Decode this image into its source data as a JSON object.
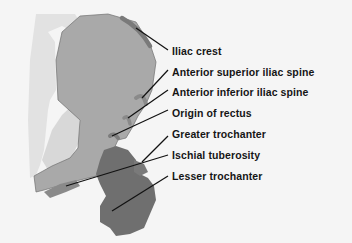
{
  "diagram": {
    "title": "",
    "colors": {
      "background": "#f5f5f5",
      "shadow_region": "#e3e3e3",
      "ilium": "#a8a8a8",
      "ilium_outline": "#707070",
      "femur": "#6e6e6e",
      "attachment": "#7c7c7c",
      "leader_line": "#111111",
      "label_text": "#151515"
    },
    "labels": [
      {
        "id": "iliac-crest",
        "text": "Iliac crest"
      },
      {
        "id": "anterior-superior-iliac-spine",
        "text": "Anterior superior iliac spine"
      },
      {
        "id": "anterior-inferior-iliac-spine",
        "text": "Anterior inferior iliac spine"
      },
      {
        "id": "origin-of-rectus",
        "text": "Origin of rectus"
      },
      {
        "id": "greater-trochanter",
        "text": "Greater trochanter"
      },
      {
        "id": "ischial-tuberosity",
        "text": "Ischial tuberosity"
      },
      {
        "id": "lesser-trochanter",
        "text": "Lesser trochanter"
      }
    ]
  }
}
